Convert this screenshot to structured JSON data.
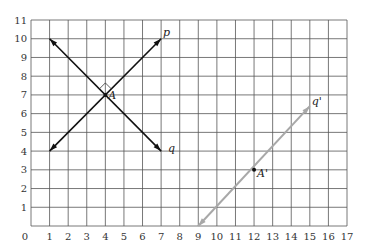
{
  "diagram": {
    "type": "coordinate-grid",
    "x_range": [
      0,
      17
    ],
    "y_range": [
      0,
      11
    ],
    "x_ticks": [
      "0",
      "1",
      "2",
      "3",
      "4",
      "5",
      "6",
      "7",
      "8",
      "9",
      "10",
      "11",
      "12",
      "13",
      "14",
      "15",
      "16",
      "17"
    ],
    "y_ticks": [
      "1",
      "2",
      "3",
      "4",
      "5",
      "6",
      "7",
      "8",
      "9",
      "10",
      "11"
    ],
    "lines": [
      {
        "name": "p",
        "label": "p",
        "from": [
          1,
          4
        ],
        "to": [
          7,
          10
        ],
        "arrows": "both",
        "color": "#111111"
      },
      {
        "name": "q",
        "label": "q",
        "from": [
          1,
          10
        ],
        "to": [
          7,
          4
        ],
        "arrows": "both",
        "color": "#111111"
      },
      {
        "name": "q-prime",
        "label": "q'",
        "from": [
          9,
          0
        ],
        "to": [
          15,
          6.4
        ],
        "arrows": "both",
        "color": "#a8a8a8"
      }
    ],
    "points": [
      {
        "name": "A",
        "label": "A",
        "at": [
          4,
          7
        ]
      },
      {
        "name": "A-prime",
        "label": "A'",
        "at": [
          12,
          3
        ]
      }
    ],
    "right_angle_marker": {
      "at": [
        4,
        7
      ]
    }
  }
}
